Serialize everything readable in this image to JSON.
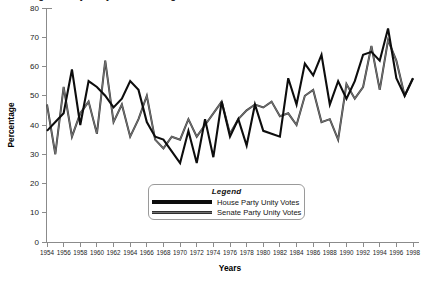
{
  "figure": {
    "clipped_title_fragment": "Figure  Party Unity Votes in Congress",
    "background_color": "#ffffff"
  },
  "legend": {
    "title": "Legend",
    "entries": [
      {
        "label": "House Party Unity Votes",
        "color": "#0d0d0d",
        "style": "thick-black"
      },
      {
        "label": "Senate Party Unity Votes",
        "color": "#707070",
        "style": "thin-gray-double"
      }
    ]
  },
  "axes": {
    "y_label": "Percentage",
    "x_label": "Years",
    "y_ticks": [
      "0",
      "10",
      "20",
      "30",
      "40",
      "50",
      "60",
      "70",
      "80"
    ],
    "x_ticks": [
      "1954",
      "1956",
      "1958",
      "1960",
      "1962",
      "1964",
      "1966",
      "1968",
      "1970",
      "1972",
      "1974",
      "1976",
      "1978",
      "1980",
      "1982",
      "1984",
      "1986",
      "1988",
      "1990",
      "1992",
      "1994",
      "1996",
      "1998"
    ]
  },
  "chart_data": {
    "type": "line",
    "title": "Party Unity Votes in Congress",
    "xlabel": "Years",
    "ylabel": "Percentage",
    "xlim": [
      1954,
      1998
    ],
    "ylim": [
      0,
      80
    ],
    "ytick_step": 10,
    "xtick_step": 2,
    "grid": false,
    "legend_position": "bottom-center",
    "x": [
      1954,
      1955,
      1956,
      1957,
      1958,
      1959,
      1960,
      1961,
      1962,
      1963,
      1964,
      1965,
      1966,
      1967,
      1968,
      1969,
      1970,
      1971,
      1972,
      1973,
      1974,
      1975,
      1976,
      1977,
      1978,
      1979,
      1980,
      1981,
      1982,
      1983,
      1984,
      1985,
      1986,
      1987,
      1988,
      1989,
      1990,
      1991,
      1992,
      1993,
      1994,
      1995,
      1996,
      1997,
      1998
    ],
    "series": [
      {
        "name": "House Party Unity Votes",
        "color": "#0d0d0d",
        "values": [
          38,
          41,
          44,
          59,
          40,
          55,
          53,
          50,
          46,
          49,
          55,
          52,
          41,
          36,
          35,
          31,
          27,
          38,
          27,
          42,
          29,
          48,
          36,
          42,
          33,
          47,
          38,
          37,
          36,
          56,
          47,
          61,
          57,
          64,
          47,
          55,
          49,
          55,
          64,
          65,
          62,
          73,
          56,
          50,
          56
        ]
      },
      {
        "name": "Senate Party Unity Votes",
        "color": "#707070",
        "values": [
          47,
          30,
          53,
          36,
          44,
          48,
          37,
          62,
          41,
          47,
          36,
          42,
          50,
          35,
          32,
          36,
          35,
          42,
          36,
          40,
          44,
          48,
          37,
          42,
          45,
          47,
          46,
          48,
          43,
          44,
          40,
          50,
          52,
          41,
          42,
          35,
          54,
          49,
          53,
          67,
          52,
          69,
          62,
          50,
          56
        ]
      }
    ]
  }
}
